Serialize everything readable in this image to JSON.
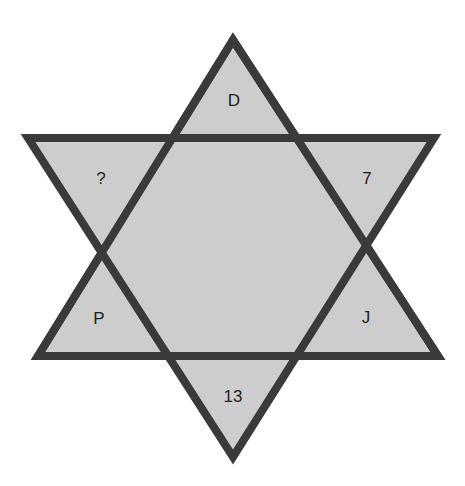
{
  "diagram": {
    "type": "hexagram-puzzle",
    "fill_color": "#cdcdcd",
    "stroke_color": "#3a3a3a",
    "regions": [
      {
        "position": "top",
        "label": "D"
      },
      {
        "position": "upper-left",
        "label": "?"
      },
      {
        "position": "upper-right",
        "label": "7"
      },
      {
        "position": "lower-left",
        "label": "P"
      },
      {
        "position": "lower-right",
        "label": "J"
      },
      {
        "position": "bottom",
        "label": "13"
      }
    ]
  }
}
